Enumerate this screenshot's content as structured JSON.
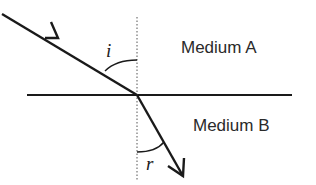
{
  "diagram": {
    "labels": {
      "medium_a": "Medium A",
      "medium_b": "Medium B",
      "angle_incidence": "i",
      "angle_refraction": "r"
    },
    "colors": {
      "line": "#1a1a1a",
      "text": "#2a2a2a",
      "background": "#ffffff"
    },
    "elements": {
      "interface": {
        "x1": 27,
        "y1": 95,
        "x2": 292,
        "y2": 95
      },
      "normal": {
        "x": 137,
        "y1": 17,
        "y2": 180,
        "style": "dotted"
      },
      "incident_ray": {
        "x1": 2,
        "y1": 14,
        "x2": 137,
        "y2": 95
      },
      "refracted_ray": {
        "x1": 137,
        "y1": 95,
        "x2": 183,
        "y2": 176
      }
    }
  }
}
